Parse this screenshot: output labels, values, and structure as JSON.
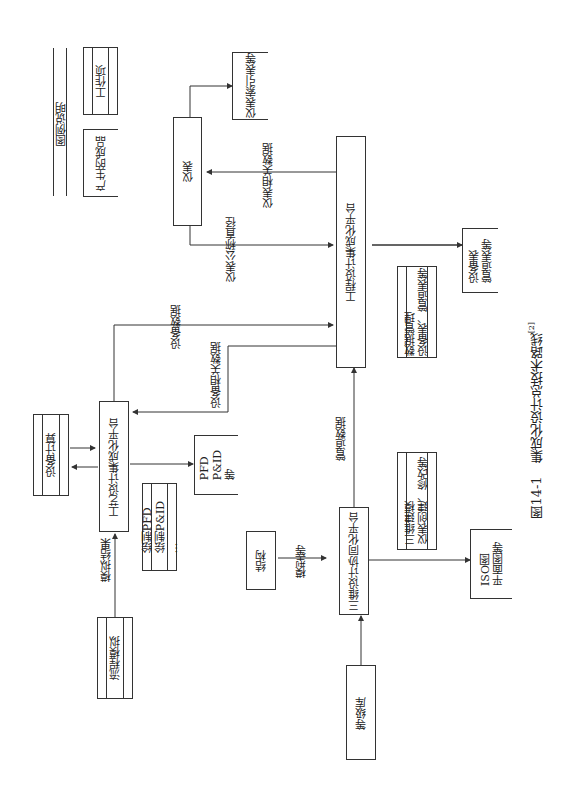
{
  "legend": {
    "title": "图例说明",
    "work_item": "工作项",
    "product": "产生的成品"
  },
  "nodes": {
    "instrument": {
      "label": "仪表",
      "sub": "..."
    },
    "instrument_index": {
      "label": "仪表索引表等"
    },
    "eng_platform": {
      "label": "工程设计集成化平台"
    },
    "data_mgmt": {
      "line1": "数据管理",
      "line2": "设备表、管道表等"
    },
    "equip_pipe_list": {
      "line1": "设备表",
      "line2": "管道表等"
    },
    "equip_calc": {
      "label": "设备计算"
    },
    "process_platform": {
      "label": "工艺设计集成化平台"
    },
    "draw_pfd": {
      "line1": "绘制PFD",
      "line2": "绘制P&ID",
      "line3": "..."
    },
    "pfd_output": {
      "line1": "PFD",
      "line2": "P&ID",
      "line3": "等"
    },
    "flow_sim": {
      "label": "流程模拟"
    },
    "structure": {
      "label": "结构",
      "sub": "..."
    },
    "platform_3d": {
      "label": "三维设计协同化平台"
    },
    "modeling": {
      "line1": "三维建模",
      "line2": "仪表创建、修改等"
    },
    "iso_output": {
      "line1": "ISO图",
      "line2": "平面图等"
    },
    "grade_lib": {
      "label": "等级库"
    }
  },
  "edges": {
    "inst_nominal": "仪表公称直径",
    "inst_related": "仪表相关数据",
    "equip_data": "设备数据",
    "equip_related": "设备相关数据",
    "pipe_data": "管道数据",
    "sim_result": "模拟结果",
    "model_etc": "模型等",
    "ellipsis": "..."
  },
  "caption": {
    "text": "图14-1　集成化设计总技术路线",
    "ref": "[2]"
  }
}
